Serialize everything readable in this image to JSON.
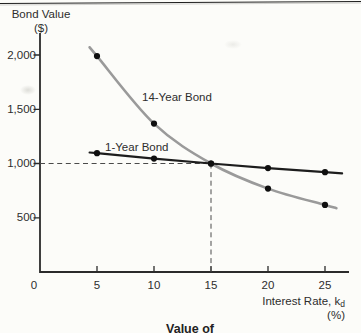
{
  "caption": {
    "text": "Value of"
  },
  "chart_data": {
    "type": "line",
    "title": "",
    "x": [
      5,
      10,
      15,
      20,
      25
    ],
    "series": [
      {
        "name": "14-Year Bond",
        "values": [
          1990,
          1368,
          1000,
          769,
          618
        ],
        "color": "#9a9a9a",
        "line_width": 2.6,
        "curve": "smooth"
      },
      {
        "name": "1-Year Bond",
        "values": [
          1095,
          1045,
          1000,
          958,
          920
        ],
        "color": "#1d1d1d",
        "line_width": 2.2,
        "curve": "straight"
      }
    ],
    "marker_color": "#0f0f0f",
    "xlabel_main": "Interest Rate, k",
    "xlabel_sub": "d",
    "xlabel_unit": "(%)",
    "ylabel_line1": "Bond Value",
    "ylabel_line2": "($)",
    "x_ticks": [
      {
        "value": 0,
        "label": "0"
      },
      {
        "value": 5,
        "label": "5"
      },
      {
        "value": 10,
        "label": "10"
      },
      {
        "value": 15,
        "label": "15"
      },
      {
        "value": 20,
        "label": "20"
      },
      {
        "value": 25,
        "label": "25"
      }
    ],
    "y_ticks": [
      {
        "value": 2000,
        "label": "2,000"
      },
      {
        "value": 1500,
        "label": "1,500"
      },
      {
        "value": 1000,
        "label": "1,000"
      },
      {
        "value": 500,
        "label": "500"
      }
    ],
    "xlim": [
      0,
      27
    ],
    "ylim": [
      0,
      2200
    ],
    "grid": false,
    "legend_position": "inline-labels",
    "reference_lines": {
      "horizontal_value": 1000,
      "vertical_rate": 15
    },
    "axis_color": "#2b2b2b",
    "dash_color": "#4a4a4a"
  }
}
